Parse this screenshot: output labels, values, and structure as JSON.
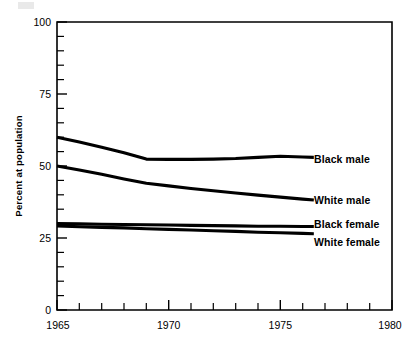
{
  "chart_data": {
    "type": "line",
    "title": "",
    "xlabel": "",
    "ylabel": "Percent at population",
    "xlim": [
      1965,
      1980
    ],
    "ylim": [
      0,
      100
    ],
    "grid": false,
    "legend_position": "inline-right-of-line-ends",
    "x_major_ticks": [
      1965,
      1970,
      1975,
      1980
    ],
    "x_major_tick_labels": [
      "1965",
      "1970",
      "1975",
      "1980"
    ],
    "x_minor_tick_step": 1,
    "y_major_ticks": [
      0,
      25,
      50,
      75,
      100
    ],
    "y_major_tick_labels": [
      "0",
      "25",
      "50",
      "75",
      "100"
    ],
    "y_minor_tick_step": 5,
    "x": [
      1965,
      1966,
      1967,
      1968,
      1969,
      1970,
      1971,
      1972,
      1973,
      1974,
      1975,
      1976,
      1976.5
    ],
    "series": [
      {
        "name": "Black male",
        "label": "Black male",
        "color": "#000000",
        "values": [
          60.0,
          58.3,
          56.5,
          54.6,
          52.4,
          52.3,
          52.3,
          52.4,
          52.6,
          53.0,
          53.4,
          53.1,
          53.0
        ]
      },
      {
        "name": "White male",
        "label": "White male",
        "color": "#000000",
        "values": [
          50.0,
          48.6,
          47.1,
          45.5,
          44.0,
          43.1,
          42.2,
          41.4,
          40.6,
          39.9,
          39.2,
          38.5,
          38.2
        ]
      },
      {
        "name": "Black female",
        "label": "Black female",
        "color": "#000000",
        "values": [
          30.0,
          29.9,
          29.8,
          29.7,
          29.6,
          29.5,
          29.4,
          29.3,
          29.2,
          29.1,
          29.1,
          29.0,
          29.0
        ]
      },
      {
        "name": "White female",
        "label": "White female",
        "color": "#000000",
        "values": [
          29.2,
          28.9,
          28.7,
          28.5,
          28.2,
          28.0,
          27.8,
          27.5,
          27.3,
          27.0,
          26.8,
          26.6,
          26.5
        ]
      }
    ]
  },
  "axis": {
    "y_title": "Percent at population",
    "y_labels": [
      "100",
      "75",
      "50",
      "25",
      "0"
    ],
    "x_labels": [
      "1965",
      "1970",
      "1975",
      "1980"
    ]
  },
  "series_labels": {
    "black_male": "Black male",
    "white_male": "White male",
    "black_female": "Black female",
    "white_female": "White female"
  }
}
